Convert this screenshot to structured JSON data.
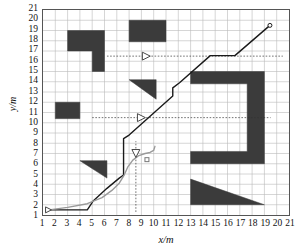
{
  "chart_data": {
    "type": "line",
    "title": "",
    "xlabel": "x/m",
    "ylabel": "y/m",
    "xlim": [
      1,
      21
    ],
    "ylim": [
      1,
      21
    ],
    "xticks": [
      1,
      2,
      3,
      4,
      5,
      6,
      7,
      8,
      9,
      10,
      11,
      12,
      13,
      14,
      15,
      16,
      17,
      18,
      19,
      20,
      21
    ],
    "yticks": [
      1,
      2,
      3,
      4,
      5,
      6,
      7,
      8,
      9,
      10,
      11,
      12,
      13,
      14,
      15,
      16,
      17,
      18,
      19,
      20,
      21
    ],
    "grid": true,
    "legend": "none",
    "series": [
      {
        "name": "planned-path",
        "color": "#1a1a1a",
        "style": "solid",
        "width": 1.4,
        "points": [
          [
            1.45,
            1.5
          ],
          [
            4.6,
            1.5
          ],
          [
            5.1,
            2.4
          ],
          [
            6.2,
            3.6
          ],
          [
            7.2,
            4.6
          ],
          [
            7.55,
            4.9
          ],
          [
            7.55,
            8.45
          ],
          [
            8.0,
            8.8
          ],
          [
            11.55,
            12.6
          ],
          [
            11.55,
            13.4
          ],
          [
            12.1,
            13.9
          ],
          [
            14.6,
            16.55
          ],
          [
            16.6,
            16.55
          ],
          [
            19.45,
            19.5
          ]
        ]
      },
      {
        "name": "actual-trajectory",
        "color": "#9a9a9a",
        "style": "solid",
        "width": 1.4,
        "points": [
          [
            1.5,
            1.5
          ],
          [
            3.0,
            1.75
          ],
          [
            4.6,
            2.1
          ],
          [
            5.8,
            2.7
          ],
          [
            6.6,
            3.4
          ],
          [
            7.2,
            4.1
          ],
          [
            7.6,
            4.9
          ],
          [
            7.9,
            5.7
          ],
          [
            8.3,
            6.35
          ],
          [
            8.8,
            6.8
          ],
          [
            9.3,
            7.0
          ],
          [
            9.7,
            7.1
          ],
          [
            10.0,
            7.3
          ],
          [
            10.1,
            7.7
          ]
        ]
      }
    ],
    "markers": [
      {
        "name": "start-marker",
        "shape": "triangle-right-outline",
        "x": 1.45,
        "y": 1.5,
        "size": 6
      },
      {
        "name": "goal-marker",
        "shape": "circle-outline",
        "x": 19.45,
        "y": 19.5,
        "size": 4
      },
      {
        "name": "robot-marker-1",
        "shape": "triangle-right-outline",
        "x": 9.4,
        "y": 16.5,
        "size": 8
      },
      {
        "name": "robot-marker-2",
        "shape": "triangle-right-outline",
        "x": 9.0,
        "y": 10.5,
        "size": 8
      },
      {
        "name": "robot-marker-3",
        "shape": "triangle-down-outline",
        "x": 8.55,
        "y": 7.0,
        "size": 8
      },
      {
        "name": "target-marker",
        "shape": "square-outline",
        "x": 9.45,
        "y": 6.4,
        "size": 4
      }
    ],
    "guide_lines": [
      {
        "name": "sensor-ray-1",
        "orientation": "horizontal",
        "y": 16.5,
        "x0": 6.2,
        "x1": 20.5,
        "style": "dotted"
      },
      {
        "name": "sensor-ray-2",
        "orientation": "horizontal",
        "y": 10.5,
        "x0": 5.0,
        "x1": 19.5,
        "style": "dotted"
      },
      {
        "name": "sensor-ray-3",
        "orientation": "vertical",
        "x": 8.55,
        "y0": 1.3,
        "y1": 8.2,
        "style": "dotted"
      }
    ],
    "obstacles": [
      {
        "name": "obstacle-L-shape",
        "type": "polygon",
        "points": [
          [
            3,
            19
          ],
          [
            6,
            19
          ],
          [
            6,
            15
          ],
          [
            5,
            15
          ],
          [
            5,
            17
          ],
          [
            3,
            17
          ]
        ]
      },
      {
        "name": "obstacle-rect-top",
        "type": "polygon",
        "points": [
          [
            8,
            20
          ],
          [
            11,
            20
          ],
          [
            11,
            17.9
          ],
          [
            8,
            17.9
          ]
        ]
      },
      {
        "name": "obstacle-rect-left",
        "type": "polygon",
        "points": [
          [
            2,
            12
          ],
          [
            4,
            12
          ],
          [
            4,
            10.4
          ],
          [
            2,
            10.4
          ]
        ]
      },
      {
        "name": "obstacle-triangle-mid",
        "type": "polygon",
        "points": [
          [
            8,
            14.2
          ],
          [
            10.2,
            14.2
          ],
          [
            10.2,
            12.3
          ]
        ]
      },
      {
        "name": "obstacle-triangle-left",
        "type": "polygon",
        "points": [
          [
            4,
            6.3
          ],
          [
            6.2,
            6.3
          ],
          [
            6.2,
            4.6
          ]
        ]
      },
      {
        "name": "obstacle-c-shape",
        "type": "polygon",
        "points": [
          [
            13,
            15
          ],
          [
            19,
            15
          ],
          [
            19,
            6
          ],
          [
            13,
            6
          ],
          [
            13,
            7.2
          ],
          [
            17.6,
            7.2
          ],
          [
            17.6,
            13.8
          ],
          [
            13,
            13.8
          ]
        ]
      },
      {
        "name": "obstacle-triangle-bottom",
        "type": "polygon",
        "points": [
          [
            13,
            4.5
          ],
          [
            19,
            2
          ],
          [
            13,
            2
          ]
        ]
      }
    ]
  },
  "axes": {
    "x_title": "x/m",
    "y_title": "y/m"
  },
  "colors": {
    "obstacle": "#3b3b3b",
    "grid": "#b9b9b9",
    "frame": "#555555",
    "planned_path": "#1a1a1a",
    "actual_path": "#9a9a9a",
    "guide": "#333333"
  }
}
